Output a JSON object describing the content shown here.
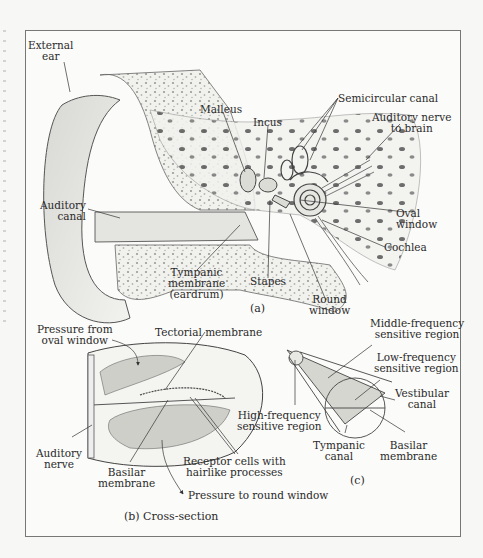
{
  "figure": {
    "panel_a": {
      "caption": "(a)",
      "labels": {
        "external_ear": [
          "External",
          "ear"
        ],
        "auditory_canal": [
          "Auditory",
          "canal"
        ],
        "malleus": "Malleus",
        "incus": "Incus",
        "semicircular_canal": "Semicircular canal",
        "auditory_nerve_to_brain": [
          "Auditory nerve",
          "to brain"
        ],
        "oval_window": [
          "Oval",
          "window"
        ],
        "cochlea": "Cochlea",
        "tympanic_membrane": [
          "Tympanic",
          "membrane",
          "(eardrum)"
        ],
        "stapes": "Stapes",
        "round_window": [
          "Round",
          "window"
        ]
      }
    },
    "panel_b": {
      "caption": "(b) Cross-section",
      "labels": {
        "pressure_from_oval_window": [
          "Pressure from",
          "oval window"
        ],
        "tectorial_membrane": "Tectorial membrane",
        "auditory_nerve": [
          "Auditory",
          "nerve"
        ],
        "basilar_membrane": [
          "Basilar",
          "membrane"
        ],
        "receptor_cells": [
          "Receptor cells with",
          "hairlike processes"
        ],
        "pressure_to_round_window": "Pressure to round window"
      }
    },
    "panel_c": {
      "caption": "(c)",
      "labels": {
        "middle_frequency": [
          "Middle-frequency",
          "sensitive region"
        ],
        "low_frequency": [
          "Low-frequency",
          "sensitive region"
        ],
        "high_frequency": [
          "High-frequency",
          "sensitive region"
        ],
        "vestibular_canal": [
          "Vestibular",
          "canal"
        ],
        "tympanic_canal": [
          "Tympanic",
          "canal"
        ],
        "basilar_membrane": [
          "Basilar",
          "membrane"
        ]
      }
    }
  },
  "colors": {
    "ink": "#2a2a2a",
    "frame": "#777777",
    "paper": "#fbfbf9",
    "shade": "#c9c9c4"
  }
}
